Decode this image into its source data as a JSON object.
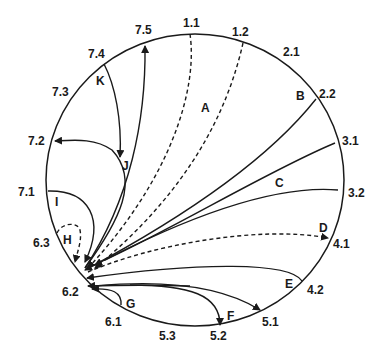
{
  "diagram": {
    "type": "circular-transition-diagram",
    "node_labels": [
      {
        "id": "1.1",
        "x": 183,
        "y": 27
      },
      {
        "id": "1.2",
        "x": 232,
        "y": 36
      },
      {
        "id": "2.1",
        "x": 283,
        "y": 56
      },
      {
        "id": "2.2",
        "x": 319,
        "y": 98
      },
      {
        "id": "3.1",
        "x": 342,
        "y": 145
      },
      {
        "id": "3.2",
        "x": 348,
        "y": 197
      },
      {
        "id": "4.1",
        "x": 333,
        "y": 248
      },
      {
        "id": "4.2",
        "x": 307,
        "y": 294
      },
      {
        "id": "5.1",
        "x": 262,
        "y": 326
      },
      {
        "id": "5.2",
        "x": 210,
        "y": 340
      },
      {
        "id": "5.3",
        "x": 159,
        "y": 340
      },
      {
        "id": "6.1",
        "x": 105,
        "y": 326
      },
      {
        "id": "6.2",
        "x": 62,
        "y": 296
      },
      {
        "id": "6.3",
        "x": 33,
        "y": 247
      },
      {
        "id": "7.1",
        "x": 18,
        "y": 196
      },
      {
        "id": "7.2",
        "x": 28,
        "y": 145
      },
      {
        "id": "7.3",
        "x": 52,
        "y": 96
      },
      {
        "id": "7.4",
        "x": 88,
        "y": 58
      },
      {
        "id": "7.5",
        "x": 135,
        "y": 34
      }
    ],
    "path_labels": [
      {
        "id": "A",
        "x": 201,
        "y": 112
      },
      {
        "id": "B",
        "x": 296,
        "y": 100
      },
      {
        "id": "C",
        "x": 275,
        "y": 187
      },
      {
        "id": "D",
        "x": 319,
        "y": 232
      },
      {
        "id": "E",
        "x": 285,
        "y": 288
      },
      {
        "id": "F",
        "x": 227,
        "y": 320
      },
      {
        "id": "G",
        "x": 126,
        "y": 308
      },
      {
        "id": "H",
        "x": 63,
        "y": 244
      },
      {
        "id": "I",
        "x": 55,
        "y": 206
      },
      {
        "id": "J",
        "x": 122,
        "y": 170
      },
      {
        "id": "K",
        "x": 96,
        "y": 85
      }
    ],
    "hub_node": "6.2",
    "colors": {
      "stroke": "#1a1a1a",
      "background": "#ffffff"
    }
  }
}
